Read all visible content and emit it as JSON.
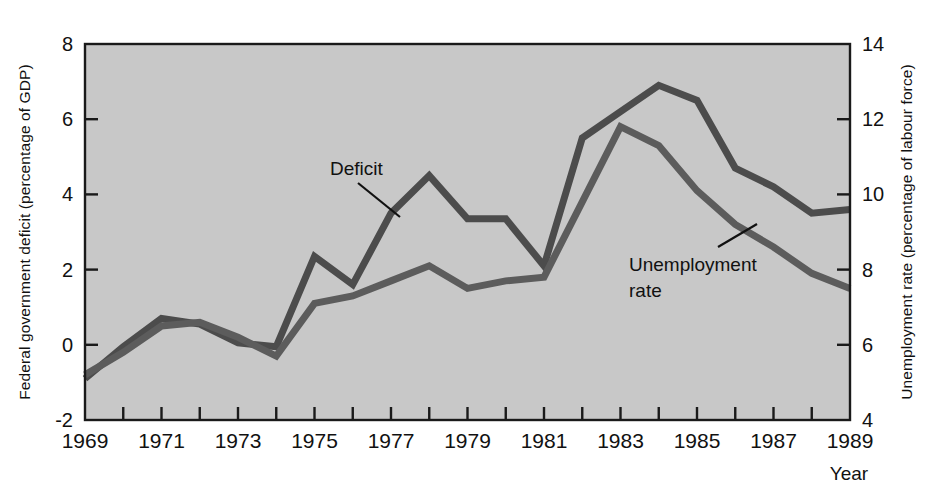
{
  "chart_data": {
    "type": "line",
    "title": "",
    "xlabel": "Year",
    "x": [
      1969,
      1970,
      1971,
      1972,
      1973,
      1974,
      1975,
      1976,
      1977,
      1978,
      1979,
      1980,
      1981,
      1982,
      1983,
      1984,
      1985,
      1986,
      1987,
      1988,
      1989
    ],
    "xlim": [
      1969,
      1989
    ],
    "xtick_labels": [
      "1969",
      "1971",
      "1973",
      "1975",
      "1977",
      "1979",
      "1981",
      "1983",
      "1985",
      "1987",
      "1989"
    ],
    "xticks_minor_every": 1,
    "grid": false,
    "legend_position": "inline-annotations",
    "axes": [
      {
        "id": "left",
        "label": "Federal government deficit (percentage of GDP)",
        "ylim": [
          -2,
          8
        ],
        "ticks": [
          8,
          6,
          4,
          2,
          0,
          -2
        ],
        "tick_labels": [
          "8",
          "6",
          "4",
          "2",
          "0",
          "-2"
        ]
      },
      {
        "id": "right",
        "label": "Unemployment rate (percentage of labour force)",
        "ylim": [
          4,
          14
        ],
        "ticks": [
          14,
          12,
          10,
          8,
          6,
          4
        ],
        "tick_labels": [
          "14",
          "12",
          "10",
          "8",
          "6",
          "4"
        ]
      }
    ],
    "series": [
      {
        "name": "Deficit",
        "axis": "left",
        "color": "#4c4c4c",
        "annotation": "Deficit",
        "values": [
          -0.9,
          -0.05,
          0.7,
          0.55,
          0.05,
          -0.05,
          2.35,
          1.6,
          3.5,
          4.5,
          3.35,
          3.35,
          2.1,
          5.5,
          6.2,
          6.9,
          6.5,
          4.7,
          4.2,
          3.5,
          3.6
        ]
      },
      {
        "name": "Unemployment rate",
        "axis": "right",
        "color": "#5c5c5c",
        "annotation_line1": "Unemployment",
        "annotation_line2": "rate",
        "values": [
          5.2,
          5.8,
          6.5,
          6.6,
          6.2,
          5.7,
          7.1,
          7.3,
          7.7,
          8.1,
          7.5,
          7.7,
          7.8,
          9.8,
          11.8,
          11.3,
          10.1,
          9.2,
          8.6,
          7.9,
          7.5
        ]
      }
    ],
    "annotations": [
      {
        "text": "Deficit",
        "x": 1976.0,
        "y_left": 5.45
      },
      {
        "text": "Unemployment rate",
        "x": 1984.6,
        "y_right": 8.1
      }
    ]
  },
  "figure": {
    "plot_background": "#c8c8c8",
    "frame_color": "#1a1a1a",
    "text_color": "#111111",
    "page_background": "#ffffff"
  }
}
